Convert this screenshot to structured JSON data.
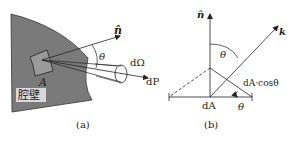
{
  "panel_a": {
    "caption": "(a)",
    "wall_label": "腔壁",
    "area_label": "A",
    "normal_label": "n̂",
    "angle_label": "θ",
    "solid_angle_label": "dΩ",
    "power_label": "dP",
    "wall_color": "#7a7a7a"
  },
  "panel_b": {
    "caption": "(b)",
    "normal_label": "n̂",
    "direction_label": "k",
    "angle_top_label": "θ",
    "angle_bottom_label": "θ",
    "area_label": "dA",
    "projected_label": "dA·cosθ"
  }
}
